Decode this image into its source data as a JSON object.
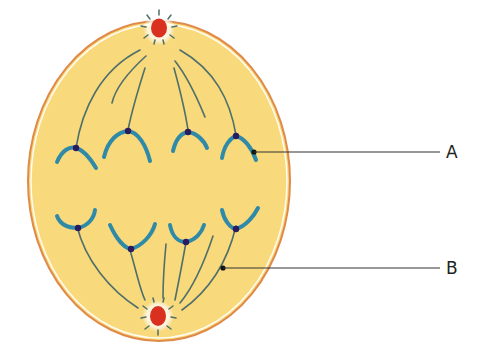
{
  "diagram": {
    "type": "cell-division-anaphase",
    "colors": {
      "cytoplasm": "#f8d97c",
      "membrane": "#e08a4a",
      "membrane_inner": "#ffffff",
      "chromosome": "#2f8aa8",
      "centromere": "#2a1a5e",
      "spindle": "#4f6f6a",
      "centrosome": "#d9301f",
      "leader": "#333333"
    },
    "labels": [
      {
        "id": "A",
        "text": "A",
        "points_to": "chromosome"
      },
      {
        "id": "B",
        "text": "B",
        "points_to": "spindle-fiber"
      }
    ]
  }
}
